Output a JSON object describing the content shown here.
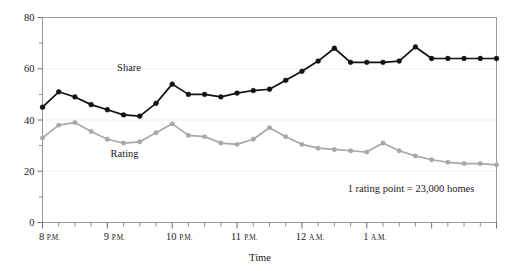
{
  "chart_data": {
    "type": "line",
    "title": "",
    "xlabel": "Time",
    "ylabel": "",
    "ylim": [
      0,
      80
    ],
    "yticks": [
      0,
      20,
      40,
      60,
      80
    ],
    "yticks_minor": [
      10,
      30,
      50,
      70
    ],
    "grid": true,
    "legend_position": "inline-labels",
    "annotation": "1 rating point = 23,000 homes",
    "x_tick_labels": [
      {
        "num": "8",
        "meridiem": "P.M."
      },
      {
        "num": "9",
        "meridiem": "P.M."
      },
      {
        "num": "10",
        "meridiem": "P.M."
      },
      {
        "num": "11",
        "meridiem": "P.M."
      },
      {
        "num": "12",
        "meridiem": "A.M."
      },
      {
        "num": "1",
        "meridiem": "A.M."
      }
    ],
    "x_minor_ticks_per_hour": 4,
    "x": [
      0,
      1,
      2,
      3,
      4,
      5,
      6,
      7,
      8,
      9,
      10,
      11,
      12,
      13,
      14,
      15,
      16,
      17,
      18,
      19,
      20,
      21,
      22,
      23,
      24,
      25,
      26,
      27,
      28
    ],
    "series": [
      {
        "name": "Share",
        "color": "#111111",
        "marker": "circle",
        "values": [
          45,
          51,
          49,
          46,
          44,
          42,
          41.5,
          46.5,
          54,
          50,
          50,
          49,
          50.5,
          51.5,
          52,
          55.5,
          59,
          63,
          68,
          62.5,
          62.5,
          62.5,
          63,
          68.5,
          64,
          64,
          64,
          64,
          64
        ]
      },
      {
        "name": "Rating",
        "color": "#a8a8a8",
        "marker": "circle",
        "values": [
          33,
          38,
          39,
          35.5,
          32.5,
          31,
          31.5,
          35,
          38.5,
          34,
          33.5,
          31,
          30.5,
          32.5,
          37,
          33.5,
          30.5,
          29,
          28.5,
          28,
          27.5,
          31,
          28,
          26,
          24.5,
          23.5,
          23,
          23,
          22.5
        ]
      }
    ],
    "series_labels": [
      {
        "text": "Share",
        "x": 4.6,
        "y": 59
      },
      {
        "text": "Rating",
        "x": 4.2,
        "y": 25.5
      }
    ]
  }
}
